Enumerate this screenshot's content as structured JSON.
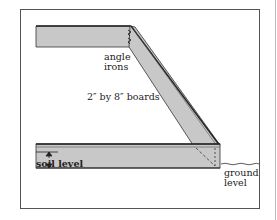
{
  "diagram": {
    "type": "raised garden bed cross-section",
    "labels": {
      "angle_irons_line1": "angle",
      "angle_irons_line2": "irons",
      "boards": "2″ by 8″ boards",
      "soil_level": "soil level",
      "ground_level_line1": "ground",
      "ground_level_line2": "level"
    },
    "colors": {
      "board_fill": "#c8c8c8",
      "outline": "#333333",
      "frame": "#555555"
    }
  }
}
